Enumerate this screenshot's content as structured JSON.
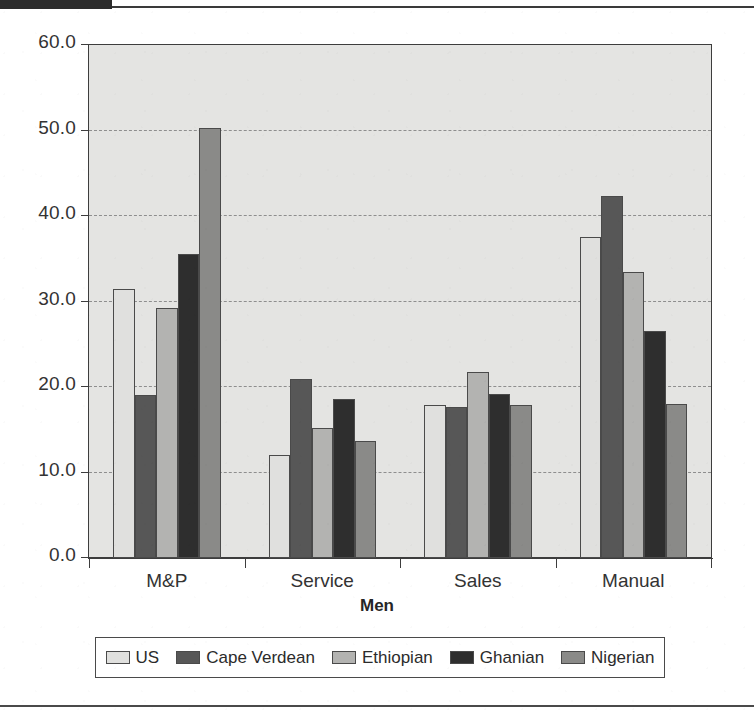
{
  "page": {
    "header_bar_present": true,
    "background_color": "#ffffff"
  },
  "chart_data": {
    "type": "bar",
    "title": "",
    "subtitle": "",
    "xlabel": "Men",
    "ylabel": "",
    "categories": [
      "M&P",
      "Service",
      "Sales",
      "Manual"
    ],
    "series": [
      {
        "name": "US",
        "color": "#e0e0de",
        "values": [
          31.5,
          12.1,
          17.9,
          37.5
        ]
      },
      {
        "name": "Cape Verdean",
        "color": "#575757",
        "values": [
          19.1,
          20.9,
          17.7,
          42.3
        ]
      },
      {
        "name": "Ethiopian",
        "color": "#b3b3b1",
        "values": [
          29.2,
          15.2,
          21.8,
          33.5
        ]
      },
      {
        "name": "Ghanian",
        "color": "#2e2e2e",
        "values": [
          35.6,
          18.6,
          19.2,
          26.5
        ]
      },
      {
        "name": "Nigerian",
        "color": "#8a8a88",
        "values": [
          50.3,
          13.7,
          17.9,
          18.0
        ]
      }
    ],
    "ylim": [
      0,
      60
    ],
    "ytick_labels": [
      "0.0",
      "10.0",
      "20.0",
      "30.0",
      "40.0",
      "50.0",
      "60.0"
    ],
    "ytick_values": [
      0,
      10,
      20,
      30,
      40,
      50,
      60
    ],
    "grid": true,
    "grid_style": "dashed-horizontal",
    "legend_position": "bottom",
    "plot_background": "#e4e4e2",
    "axis_color": "#3d3d3d"
  }
}
